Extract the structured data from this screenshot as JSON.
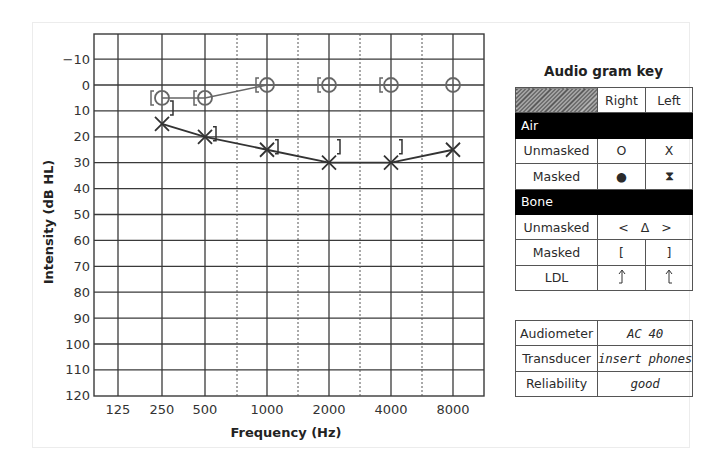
{
  "chart_data": {
    "type": "line",
    "xlabel": "Frequency (Hz)",
    "ylabel": "Intensity (dB HL)",
    "x_ticks": [
      "125",
      "250",
      "500",
      "1000",
      "2000",
      "4000",
      "8000"
    ],
    "y_ticks": [
      "-10",
      "0",
      "10",
      "20",
      "30",
      "40",
      "50",
      "60",
      "70",
      "80",
      "90",
      "100",
      "110",
      "120"
    ],
    "ylim": [
      -20,
      120
    ],
    "y_inverted": true,
    "grid": true,
    "interoctave_dashed_lines": [
      "750",
      "1500",
      "3000",
      "6000"
    ],
    "series": [
      {
        "name": "Right ear air conduction (unmasked)",
        "symbol": "O",
        "connected": true,
        "x": [
          "250",
          "500",
          "1000",
          "2000",
          "4000",
          "8000"
        ],
        "values": [
          5,
          5,
          0,
          0,
          0,
          0
        ]
      },
      {
        "name": "Left ear air conduction (unmasked)",
        "symbol": "X",
        "connected": true,
        "x": [
          "250",
          "500",
          "1000",
          "2000",
          "4000",
          "8000"
        ],
        "values": [
          15,
          20,
          25,
          30,
          30,
          25
        ]
      },
      {
        "name": "Right ear bone conduction (masked)",
        "symbol": "[",
        "connected": false,
        "x": [
          "250",
          "500",
          "1000",
          "2000",
          "4000"
        ],
        "values": [
          5,
          5,
          0,
          0,
          0
        ]
      },
      {
        "name": "Left ear bone conduction (masked)",
        "symbol": "]",
        "connected": false,
        "x": [
          "250",
          "500",
          "1000",
          "2000",
          "4000"
        ],
        "values": [
          10,
          20,
          25,
          25,
          25
        ]
      }
    ]
  },
  "axis": {
    "xlabel": "Frequency (Hz)",
    "ylabel": "Intensity (dB HL)",
    "x_ticks": [
      "125",
      "250",
      "500",
      "1000",
      "2000",
      "4000",
      "8000"
    ],
    "y_ticks": [
      "-10",
      "0",
      "10",
      "20",
      "30",
      "40",
      "50",
      "60",
      "70",
      "80",
      "90",
      "100",
      "110",
      "120"
    ]
  },
  "key": {
    "title": "Audio gram key",
    "headers": {
      "right": "Right",
      "left": "Left"
    },
    "air_label": "Air",
    "bone_label": "Bone",
    "air_rows": [
      {
        "label": "Unmasked",
        "right": "O",
        "left": "X"
      },
      {
        "label": "Masked",
        "right": "●",
        "left": "⧗"
      }
    ],
    "bone_rows": [
      {
        "label": "Unmasked",
        "combined": "<   Δ   >"
      },
      {
        "label": "Masked",
        "right": "[",
        "left": "]"
      },
      {
        "label": "LDL",
        "right": "⥌",
        "left": "⥌"
      }
    ]
  },
  "info": {
    "rows": [
      {
        "label": "Audiometer",
        "value": "AC 40"
      },
      {
        "label": "Transducer",
        "value": "insert phones"
      },
      {
        "label": "Reliability",
        "value": "good"
      }
    ]
  },
  "colors": {
    "grid": "#3a3a3a",
    "right_series": "#555555",
    "left_series": "#333333",
    "section_bg": "#000000"
  }
}
